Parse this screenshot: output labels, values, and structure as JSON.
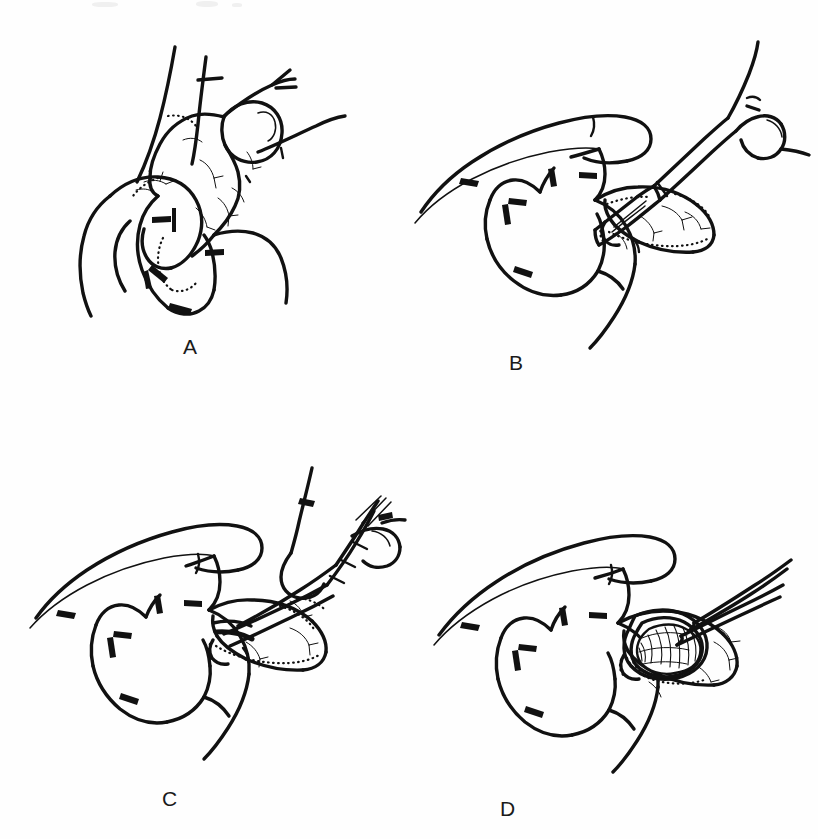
{
  "figure": {
    "kind": "surgical-technique-line-drawing",
    "background_color": "#fefefe",
    "ink_color": "#111111",
    "width": 818,
    "height": 839,
    "columns": 2,
    "rows": 2
  },
  "panels": [
    {
      "id": "A",
      "label": "A",
      "position": "top-left",
      "caption_visible": false,
      "content_summary": "Heart with atrial appendage outlined; coronary vessels branch over the surface; stippled dotted line marks the base of the appendage.",
      "instrument": "none",
      "features": [
        "appendage",
        "coronary-vessels",
        "stippled-margin",
        "great-vessels"
      ]
    },
    {
      "id": "B",
      "label": "B",
      "position": "top-right",
      "caption_visible": false,
      "content_summary": "Surgeon's hand steadies the appendage between thumb and fingers while a scalpel incises its tip.",
      "instrument": "scalpel",
      "features": [
        "hand",
        "thumb",
        "index-finger",
        "scalpel-blade",
        "scalpel-handle",
        "appendage",
        "stippled-margin",
        "coronary-vessels"
      ]
    },
    {
      "id": "C",
      "label": "C",
      "position": "bottom-left",
      "caption_visible": false,
      "content_summary": "Scissors held in the opposite hand extend the incision across the appendage held in the supporting hand.",
      "instrument": "scissors",
      "features": [
        "hand",
        "thumb",
        "index-finger",
        "scissors-blades",
        "scissors-shanks",
        "scissors-rings",
        "appendage",
        "stippled-margin"
      ]
    },
    {
      "id": "D",
      "label": "D",
      "position": "bottom-right",
      "caption_visible": false,
      "content_summary": "The appendage is opened; the everted cut edge is held and forceps enter the lumen, exposing the hatched pectinate muscle interior.",
      "instrument": "forceps",
      "features": [
        "hand",
        "thumb",
        "index-finger",
        "forceps",
        "open-appendage",
        "everted-rim",
        "pectinate-muscle-hatching",
        "stippled-margin"
      ]
    }
  ],
  "labels": {
    "a": "A",
    "b": "B",
    "c": "C",
    "d": "D"
  }
}
